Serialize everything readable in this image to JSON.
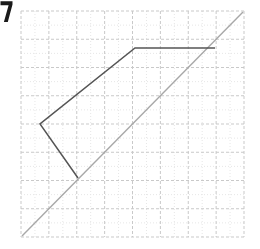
{
  "canvas": {
    "width": 260,
    "height": 249,
    "background": "#ffffff"
  },
  "plot": {
    "name": "grid-plot",
    "area": {
      "x": 21,
      "y": 11,
      "width": 223,
      "height": 226
    },
    "grid": {
      "major_color": "#c9c9c9",
      "minor_color": "#e6e6e6",
      "major_dash": "3 2",
      "minor_dash": "1 2",
      "major_cols": 8,
      "major_rows": 8,
      "minor_per_major": 2,
      "major_step_x": 27.875,
      "major_step_y": 28.25,
      "grid_on": true
    }
  },
  "corner_glyph": {
    "label": "7",
    "color": "#1a1a1a",
    "x": 1,
    "y": 1,
    "width": 13,
    "height": 22
  },
  "chart_data": {
    "type": "line",
    "title": "",
    "subtitle": "",
    "xlabel": "",
    "ylabel": "",
    "xlim": [
      0,
      8
    ],
    "ylim": [
      0,
      8
    ],
    "grid": true,
    "legend": "none",
    "tick_labels_x": [],
    "tick_labels_y": [],
    "annotations": [],
    "series": [
      {
        "name": "reference-diagonal",
        "type": "line",
        "color": "#a8a8a8",
        "width": 1.4,
        "points_px": [
          [
            22,
            236
          ],
          [
            243,
            12
          ]
        ],
        "points_data": [
          [
            0.03,
            0.02
          ],
          [
            7.96,
            7.96
          ]
        ]
      },
      {
        "name": "polyline-path",
        "type": "line",
        "color": "#555555",
        "width": 1.5,
        "points_px": [
          [
            78,
            178
          ],
          [
            40,
            124
          ],
          [
            135,
            48
          ],
          [
            215,
            48
          ]
        ],
        "points_data": [
          [
            2.04,
            2.09
          ],
          [
            0.68,
            4.0
          ],
          [
            4.09,
            6.69
          ],
          [
            6.96,
            6.69
          ]
        ]
      }
    ]
  }
}
